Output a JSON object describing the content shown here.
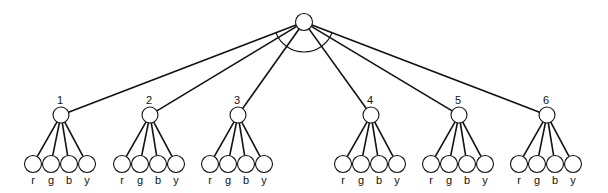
{
  "diagram": {
    "type": "tree",
    "root": {
      "id": "root",
      "label": ""
    },
    "groups": [
      {
        "label": "1",
        "leaves": [
          "r",
          "g",
          "b",
          "y"
        ]
      },
      {
        "label": "2",
        "leaves": [
          "r",
          "g",
          "b",
          "y"
        ]
      },
      {
        "label": "3",
        "leaves": [
          "r",
          "g",
          "b",
          "y"
        ]
      },
      {
        "label": "4",
        "leaves": [
          "r",
          "g",
          "b",
          "y"
        ]
      },
      {
        "label": "5",
        "leaves": [
          "r",
          "g",
          "b",
          "y"
        ]
      },
      {
        "label": "6",
        "leaves": [
          "r",
          "g",
          "b",
          "y"
        ]
      }
    ],
    "root_arc": true
  },
  "layout": {
    "root": {
      "x": 304,
      "y": 22,
      "r": 8.5
    },
    "mid_y": 115,
    "mid_r": 8,
    "mid_x": [
      61,
      150,
      238,
      371,
      459,
      547
    ],
    "leaf_y": 164,
    "leaf_r": 8.5,
    "leaf_dx": [
      -28,
      -10,
      8,
      26
    ],
    "label_offset_y": -10,
    "leaf_label_y": 184,
    "arc_radius": 30
  }
}
